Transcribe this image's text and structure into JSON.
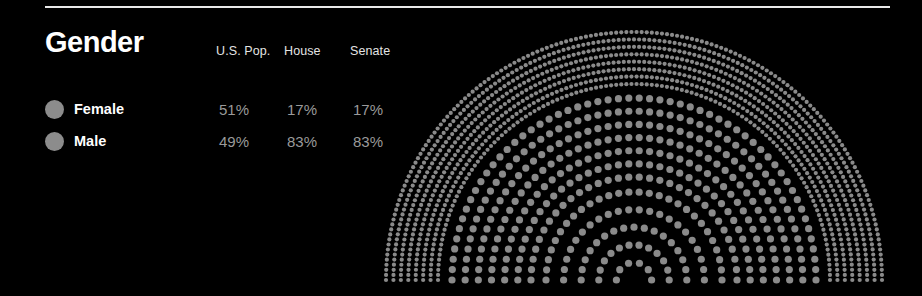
{
  "page": {
    "background_color": "#000000",
    "rule_color": "#e8e8e8"
  },
  "panel": {
    "title": "Gender"
  },
  "table": {
    "columns": [
      "U.S. Pop.",
      "House",
      "Senate"
    ],
    "rows": [
      {
        "label": "Female",
        "dot_color": "#8c8c8c",
        "values": [
          "51%",
          "17%",
          "17%"
        ]
      },
      {
        "label": "Male",
        "dot_color": "#8c8c8c",
        "values": [
          "49%",
          "83%",
          "83%"
        ]
      }
    ]
  },
  "chart_data": {
    "type": "pie",
    "title": "Gender",
    "subtype": "concentric-semicircle-dot-arcs",
    "xlabel": "",
    "ylabel": "",
    "legend_position": "left",
    "grid": false,
    "categories": [
      "Female",
      "Male"
    ],
    "series": [
      {
        "name": "U.S. Pop.",
        "ring": "outer",
        "values": [
          51,
          49
        ],
        "unit": "%"
      },
      {
        "name": "House",
        "ring": "middle",
        "values": [
          17,
          83
        ],
        "unit": "%"
      },
      {
        "name": "Senate",
        "ring": "inner",
        "values": [
          17,
          83
        ],
        "unit": "%"
      }
    ],
    "colors": {
      "dot": "#8a8a8a",
      "background": "#000000"
    },
    "geometry": {
      "center_x": 634,
      "baseline_y": 280,
      "outer_ring": {
        "r_inner": 196,
        "r_outer": 248,
        "rows": 8,
        "dot_radius": 2.1
      },
      "middle_ring": {
        "r_inner": 103,
        "r_outer": 182,
        "rows": 7,
        "dot_radius": 3.6
      },
      "inner_ring": {
        "r_inner": 0,
        "r_outer": 88,
        "rows": 6,
        "dot_radius": 3.6
      }
    }
  }
}
